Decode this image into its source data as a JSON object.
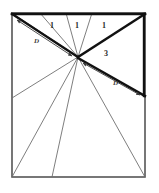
{
  "figure": {
    "canvas": {
      "width": 159,
      "height": 193
    },
    "colors": {
      "background": "#ffffff",
      "thin_stroke": "#6f6f6f",
      "thick_stroke": "#111111",
      "border_stroke": "#555555",
      "label_color": "#2a2a2a"
    },
    "square": {
      "name": "outer-square",
      "x": 12,
      "y": 13,
      "width": 133,
      "height": 164
    },
    "apex": {
      "x": 78,
      "y": 57
    },
    "thin_rays": [
      {
        "name": "ray-to-top-left-corner",
        "x": 12,
        "y": 13
      },
      {
        "name": "ray-to-top-edge-a",
        "x": 40,
        "y": 13
      },
      {
        "name": "ray-to-top-edge-b",
        "x": 66,
        "y": 13
      },
      {
        "name": "ray-to-top-edge-c",
        "x": 92,
        "y": 13
      },
      {
        "name": "ray-to-left-edge",
        "x": 12,
        "y": 98
      },
      {
        "name": "ray-to-bottom-left-corner",
        "x": 12,
        "y": 177
      },
      {
        "name": "ray-to-bottom-edge",
        "x": 52,
        "y": 177
      },
      {
        "name": "ray-to-bottom-right-corner",
        "x": 145,
        "y": 177
      }
    ],
    "thick_edges": [
      {
        "name": "thick-top-edge",
        "x1": 12,
        "y1": 14,
        "x2": 145,
        "y2": 14
      },
      {
        "name": "thick-right-edge",
        "x1": 144,
        "y1": 14,
        "x2": 144,
        "y2": 96
      },
      {
        "name": "thick-diagonal-upper-left",
        "x1": 12,
        "y1": 14,
        "x2": 78,
        "y2": 57
      },
      {
        "name": "thick-diagonal-upper-right",
        "x1": 78,
        "y1": 57,
        "x2": 145,
        "y2": 14
      },
      {
        "name": "thick-diagonal-lower-right",
        "x1": 78,
        "y1": 58,
        "x2": 145,
        "y2": 96
      }
    ],
    "dimension_arrows": [
      {
        "name": "dimension-arrow-upper-left",
        "x1": 17,
        "y1": 20,
        "x2": 72,
        "y2": 56,
        "label": "D",
        "label_x": 34,
        "label_y": 38
      },
      {
        "name": "dimension-arrow-lower-right",
        "x1": 83,
        "y1": 63,
        "x2": 140,
        "y2": 95,
        "label": "D",
        "label_x": 113,
        "label_y": 80
      }
    ],
    "segment_labels": [
      {
        "name": "segment-label-1-left",
        "text": "1",
        "x": 50,
        "y": 22
      },
      {
        "name": "segment-label-1-middle",
        "text": "1",
        "x": 75,
        "y": 22
      },
      {
        "name": "segment-label-1-right",
        "text": "1",
        "x": 102,
        "y": 22
      },
      {
        "name": "region-label-3",
        "text": "3",
        "x": 104,
        "y": 50
      }
    ]
  }
}
